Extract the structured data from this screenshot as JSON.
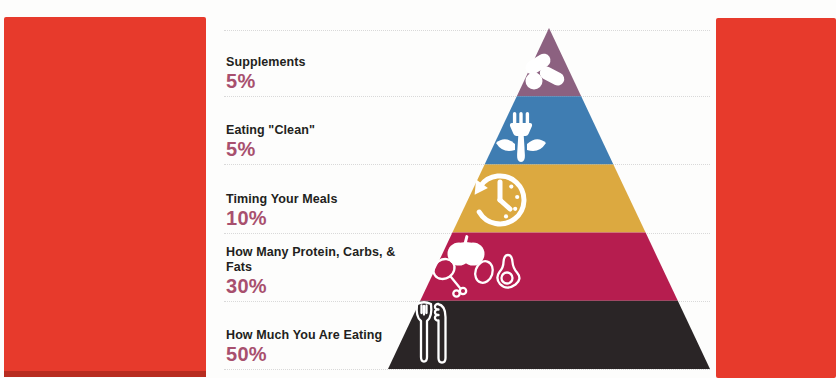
{
  "page": {
    "background": "#fdfdfc",
    "side_panel_color": "#e73a2c",
    "side_panel_edge_color": "#b82c20",
    "divider_color": "#d9d9d9",
    "label_color": "#231f20",
    "percent_color": "#a8506e"
  },
  "pyramid": {
    "name": "Nutrition Priorities Pyramid",
    "icon_color": "#ffffff",
    "levels": [
      {
        "label": "Supplements",
        "percent": "5%",
        "color": "#8c6180",
        "icon": "pills-icon"
      },
      {
        "label": "Eating \"Clean\"",
        "percent": "5%",
        "color": "#3f7db2",
        "icon": "fork-leaves-icon"
      },
      {
        "label": "Timing Your Meals",
        "percent": "10%",
        "color": "#dca940",
        "icon": "clock-arrow-icon"
      },
      {
        "label": "How Many Protein, Carbs, & Fats",
        "percent": "30%",
        "color": "#b61d4f",
        "icon": "food-macros-icon"
      },
      {
        "label": "How Much You Are Eating",
        "percent": "50%",
        "color": "#2a2526",
        "icon": "fork-knife-icon"
      }
    ]
  }
}
